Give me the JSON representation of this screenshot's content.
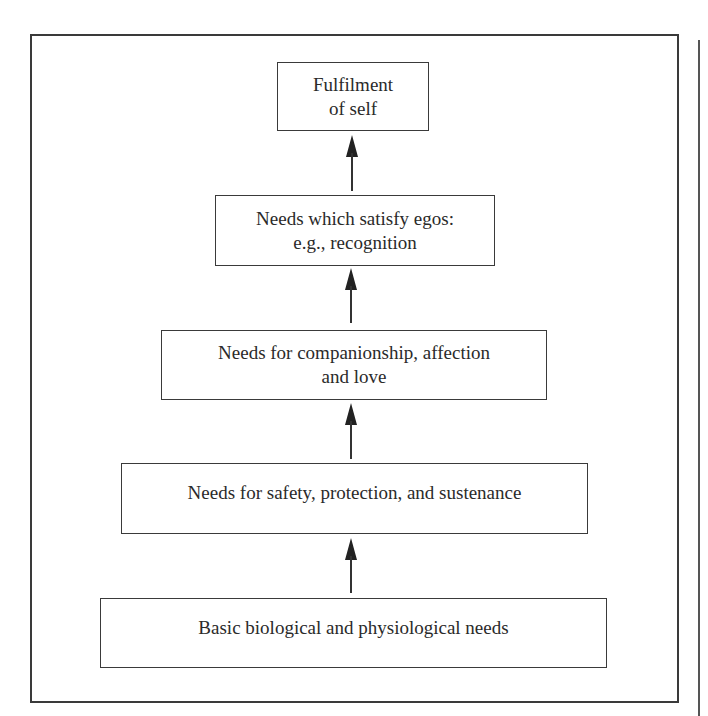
{
  "diagram": {
    "type": "hierarchy-of-needs",
    "direction": "bottom-to-top",
    "levels": [
      {
        "level": 1,
        "lines": [
          "Basic biological and physiological needs"
        ]
      },
      {
        "level": 2,
        "lines": [
          "Needs for safety, protection, and sustenance"
        ]
      },
      {
        "level": 3,
        "lines": [
          "Needs for companionship, affection",
          "and love"
        ]
      },
      {
        "level": 4,
        "lines": [
          "Needs which satisfy egos:",
          "e.g., recognition"
        ]
      },
      {
        "level": 5,
        "lines": [
          "Fulfilment",
          "of self"
        ]
      }
    ],
    "connectors": [
      {
        "from": 1,
        "to": 2,
        "type": "arrow-up"
      },
      {
        "from": 2,
        "to": 3,
        "type": "arrow-up"
      },
      {
        "from": 3,
        "to": 4,
        "type": "arrow-up"
      },
      {
        "from": 4,
        "to": 5,
        "type": "arrow-up"
      }
    ],
    "colors": {
      "line": "#3a3a3a",
      "text": "#2a2a2a",
      "background": "#ffffff"
    }
  }
}
